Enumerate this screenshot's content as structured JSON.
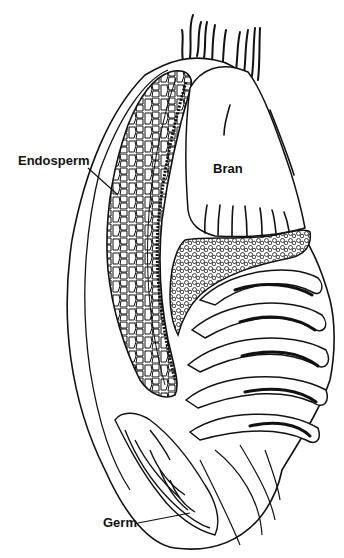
{
  "diagram": {
    "labels": {
      "endosperm": "Endosperm",
      "bran": "Bran",
      "germ": "Germ"
    },
    "colors": {
      "ink": "#111111",
      "background": "#ffffff"
    }
  }
}
